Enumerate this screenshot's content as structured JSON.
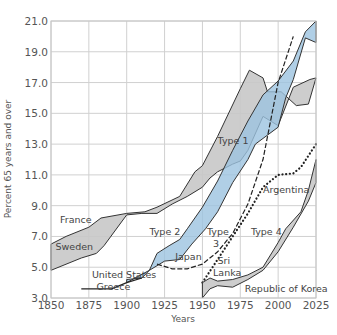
{
  "chart_data": {
    "type": "area",
    "title": "",
    "xlabel": "Years",
    "ylabel": "Percent 65 years and over",
    "xlim": [
      1850,
      2025
    ],
    "ylim": [
      3.0,
      21.0
    ],
    "x_ticks": [
      "1850",
      "1875",
      "1900",
      "1925",
      "1950",
      "1975",
      "2000",
      "2025"
    ],
    "y_ticks": [
      "3.0",
      "5.0",
      "7.0",
      "9.0",
      "11.0",
      "13.0",
      "15.0",
      "17.0",
      "19.0",
      "21.0"
    ],
    "grid": true,
    "colors": {
      "gray": "#c8c8c8",
      "blue": "#9cc3e0",
      "line": "#333333",
      "grid": "#d0d0d0"
    },
    "series": [
      {
        "name": "Type 1 (France / Sweden)",
        "kind": "band",
        "color": "gray",
        "upper": [
          [
            1850,
            6.5
          ],
          [
            1860,
            7.0
          ],
          [
            1875,
            7.6
          ],
          [
            1883,
            8.2
          ],
          [
            1900,
            8.5
          ],
          [
            1912,
            8.6
          ],
          [
            1920,
            8.9
          ],
          [
            1935,
            9.6
          ],
          [
            1945,
            11.2
          ],
          [
            1950,
            11.6
          ],
          [
            1960,
            13.5
          ],
          [
            1975,
            16.6
          ],
          [
            1981,
            17.8
          ],
          [
            1990,
            17.3
          ],
          [
            1993,
            16.4
          ],
          [
            2002,
            16.4
          ],
          [
            2012,
            15.5
          ],
          [
            2020,
            15.6
          ],
          [
            2025,
            17.3
          ]
        ],
        "lower": [
          [
            2025,
            17.3
          ],
          [
            2021,
            17.2
          ],
          [
            2010,
            16.7
          ],
          [
            2000,
            14.2
          ],
          [
            1990,
            14.8
          ],
          [
            1980,
            12.6
          ],
          [
            1975,
            11.9
          ],
          [
            1970,
            11.7
          ],
          [
            1960,
            11.2
          ],
          [
            1955,
            10.8
          ],
          [
            1950,
            10.2
          ],
          [
            1940,
            9.6
          ],
          [
            1930,
            9.1
          ],
          [
            1920,
            8.5
          ],
          [
            1910,
            8.5
          ],
          [
            1900,
            8.4
          ],
          [
            1885,
            6.4
          ],
          [
            1880,
            5.9
          ],
          [
            1870,
            5.6
          ],
          [
            1850,
            4.8
          ]
        ]
      },
      {
        "name": "Type 2 (United States / Greece)",
        "kind": "band",
        "color": "blue",
        "upper": [
          [
            1900,
            4.0
          ],
          [
            1915,
            4.8
          ],
          [
            1920,
            5.9
          ],
          [
            1928,
            6.4
          ],
          [
            1935,
            6.8
          ],
          [
            1940,
            7.5
          ],
          [
            1950,
            8.9
          ],
          [
            1960,
            10.6
          ],
          [
            1970,
            12.6
          ],
          [
            1980,
            14.5
          ],
          [
            1990,
            16.2
          ],
          [
            2000,
            17.1
          ],
          [
            2010,
            18.4
          ],
          [
            2018,
            20.3
          ],
          [
            2025,
            21.0
          ]
        ],
        "lower": [
          [
            2025,
            21.0
          ],
          [
            2025,
            19.6
          ],
          [
            2018,
            19.9
          ],
          [
            2010,
            17.2
          ],
          [
            2005,
            16.0
          ],
          [
            2000,
            14.1
          ],
          [
            1985,
            13.0
          ],
          [
            1980,
            12.0
          ],
          [
            1970,
            10.5
          ],
          [
            1960,
            8.6
          ],
          [
            1952,
            7.5
          ],
          [
            1943,
            6.5
          ],
          [
            1935,
            5.5
          ],
          [
            1925,
            5.4
          ],
          [
            1915,
            4.8
          ],
          [
            1910,
            4.3
          ],
          [
            1900,
            4.2
          ]
        ]
      },
      {
        "name": "Greece / United States early",
        "kind": "line",
        "points": [
          [
            1870,
            3.6
          ],
          [
            1890,
            3.6
          ],
          [
            1900,
            4.0
          ],
          [
            1910,
            4.3
          ]
        ]
      },
      {
        "name": "Type 3 (Japan)",
        "kind": "dashed",
        "points": [
          [
            1920,
            5.2
          ],
          [
            1930,
            4.9
          ],
          [
            1940,
            4.9
          ],
          [
            1950,
            5.2
          ],
          [
            1960,
            6.0
          ],
          [
            1970,
            7.2
          ],
          [
            1980,
            9.1
          ],
          [
            1990,
            12.0
          ],
          [
            2000,
            17.0
          ],
          [
            2010,
            20.0
          ]
        ]
      },
      {
        "name": "Argentina",
        "kind": "dotted",
        "points": [
          [
            1950,
            4.0
          ],
          [
            1960,
            5.5
          ],
          [
            1970,
            7.0
          ],
          [
            1980,
            8.5
          ],
          [
            1990,
            10.2
          ],
          [
            2000,
            11.0
          ],
          [
            2010,
            11.1
          ],
          [
            2015,
            11.5
          ],
          [
            2025,
            13.0
          ]
        ]
      },
      {
        "name": "Type 4 (Sri Lanka / Republic of Korea)",
        "kind": "band",
        "color": "gray",
        "upper": [
          [
            1950,
            4.0
          ],
          [
            1955,
            4.3
          ],
          [
            1960,
            4.1
          ],
          [
            1970,
            4.2
          ],
          [
            1980,
            4.5
          ],
          [
            1990,
            5.0
          ],
          [
            2000,
            6.6
          ],
          [
            2005,
            7.5
          ],
          [
            2015,
            8.6
          ],
          [
            2020,
            10.0
          ],
          [
            2025,
            12.0
          ]
        ],
        "lower": [
          [
            2025,
            12.0
          ],
          [
            2025,
            10.5
          ],
          [
            2020,
            9.3
          ],
          [
            2010,
            7.6
          ],
          [
            2000,
            6.0
          ],
          [
            1990,
            4.8
          ],
          [
            1980,
            4.2
          ],
          [
            1970,
            3.7
          ],
          [
            1960,
            3.8
          ],
          [
            1955,
            3.6
          ],
          [
            1950,
            3.0
          ]
        ]
      }
    ],
    "annotations": [
      {
        "text": "France",
        "x": 1856,
        "y": 7.9
      },
      {
        "text": "Sweden",
        "x": 1853,
        "y": 6.1
      },
      {
        "text": "United States",
        "x": 1877,
        "y": 4.3
      },
      {
        "text": "Greece",
        "x": 1880,
        "y": 3.5
      },
      {
        "text": "Type 1",
        "x": 1960,
        "y": 13.0
      },
      {
        "text": "Type 2",
        "x": 1915,
        "y": 7.1
      },
      {
        "text": "Type",
        "x": 1953,
        "y": 7.1
      },
      {
        "text": "3",
        "x": 1957,
        "y": 6.3
      },
      {
        "text": "Japan",
        "x": 1932,
        "y": 5.5
      },
      {
        "text": "Sri",
        "x": 1960,
        "y": 5.2
      },
      {
        "text": "Lanka",
        "x": 1957,
        "y": 4.4
      },
      {
        "text": "Argentina",
        "x": 1990,
        "y": 9.8
      },
      {
        "text": "Type 4",
        "x": 1982,
        "y": 7.1
      },
      {
        "text": "Republic of Korea",
        "x": 1978,
        "y": 3.4
      }
    ]
  }
}
